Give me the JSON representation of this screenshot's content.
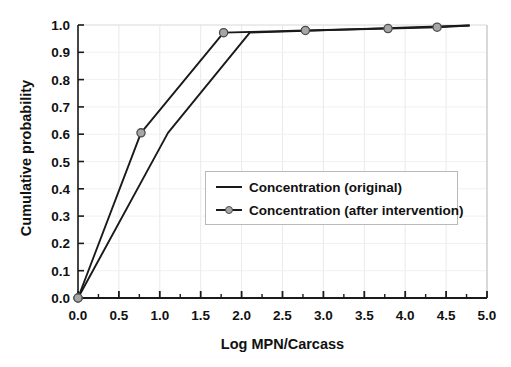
{
  "chart_data": {
    "type": "line",
    "title": "",
    "xlabel": "Log MPN/Carcass",
    "ylabel": "Cumulative probability",
    "xlim": [
      0.0,
      5.0
    ],
    "ylim": [
      0.0,
      1.0
    ],
    "xticks": [
      "0.0",
      "0.5",
      "1.0",
      "1.5",
      "2.0",
      "2.5",
      "3.0",
      "3.5",
      "4.0",
      "4.5",
      "5.0"
    ],
    "yticks": [
      "0.0",
      "0.1",
      "0.2",
      "0.3",
      "0.4",
      "0.5",
      "0.6",
      "0.7",
      "0.8",
      "0.9",
      "1.0"
    ],
    "grid": true,
    "legend_position": "center",
    "series": [
      {
        "name": "Concentration (original)",
        "marker": "none",
        "color": "#1a1a1a",
        "x": [
          0.0,
          1.1,
          2.1,
          4.78
        ],
        "y": [
          0.0,
          0.605,
          0.972,
          0.998
        ]
      },
      {
        "name": "Concentration (after intervention)",
        "marker": "circle",
        "color": "#1a1a1a",
        "marker_fill": "#a6a6a6",
        "marker_edge": "#4d4d4d",
        "x": [
          0.0,
          0.77,
          1.78,
          2.78,
          3.79,
          4.39,
          4.78
        ],
        "y": [
          0.0,
          0.605,
          0.972,
          0.98,
          0.987,
          0.992,
          0.998
        ]
      }
    ]
  },
  "legend": {
    "items": [
      {
        "label": "Concentration (original)"
      },
      {
        "label": "Concentration (after intervention)"
      }
    ]
  },
  "axes": {
    "x_axis_label": "Log MPN/Carcass",
    "y_axis_label": "Cumulative probability"
  }
}
